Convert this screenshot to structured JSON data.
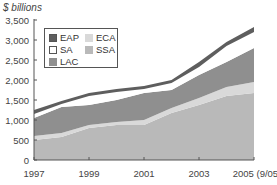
{
  "chart_data": {
    "type": "area",
    "stacked": true,
    "title": "",
    "ylabel": "$ billions",
    "xlabel": "",
    "x": [
      1997,
      1998,
      1999,
      2000,
      2001,
      2002,
      2003,
      2004,
      2005
    ],
    "x_tick_labels": [
      "1997",
      "1999",
      "2001",
      "2003",
      "2005 (9/05)"
    ],
    "y_tick_labels": [
      "0",
      "500",
      "1,000",
      "1,500",
      "2,000",
      "2,500",
      "3,000",
      "3,500"
    ],
    "ylim": [
      0,
      3500
    ],
    "grid": false,
    "legend_position": "upper-left",
    "series": [
      {
        "name": "SSA",
        "color": "#b9b9b9",
        "values": [
          500,
          575,
          800,
          875,
          875,
          1175,
          1375,
          1600,
          1675
        ]
      },
      {
        "name": "ECA",
        "color": "#d9d9d9",
        "values": [
          100,
          100,
          75,
          75,
          125,
          125,
          175,
          225,
          275
        ]
      },
      {
        "name": "LAC",
        "color": "#8f8f8f",
        "values": [
          450,
          650,
          500,
          550,
          675,
          450,
          575,
          625,
          850
        ]
      },
      {
        "name": "SA",
        "color": "#ffffff",
        "values": [
          100,
          75,
          225,
          200,
          100,
          175,
          200,
          400,
          400
        ]
      },
      {
        "name": "EAP",
        "color": "#5e5e5e",
        "values": [
          100,
          75,
          75,
          75,
          75,
          75,
          125,
          100,
          125
        ]
      }
    ]
  },
  "legend": {
    "items": [
      {
        "label": "EAP",
        "color": "#5e5e5e"
      },
      {
        "label": "SA",
        "color": "#ffffff"
      },
      {
        "label": "LAC",
        "color": "#8f8f8f"
      },
      {
        "label": "ECA",
        "color": "#d9d9d9"
      },
      {
        "label": "SSA",
        "color": "#b9b9b9"
      }
    ]
  }
}
